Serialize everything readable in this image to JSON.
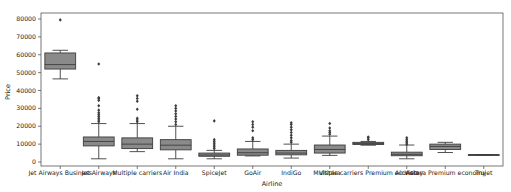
{
  "chart_data": {
    "type": "box",
    "title": "",
    "xlabel": "Airline",
    "ylabel": "Price",
    "ylim": [
      -3000,
      83000
    ],
    "yticks": [
      0,
      10000,
      20000,
      30000,
      40000,
      50000,
      60000,
      70000,
      80000
    ],
    "grid": false,
    "legend": null,
    "box_fill": "#8a8a8a",
    "line_color": "#3d3d3d",
    "categories": [
      "Jet Airways Business",
      "Jet Airways",
      "Multiple carriers",
      "Air India",
      "SpiceJet",
      "GoAir",
      "IndiGo",
      "Vistara",
      "Multiple carriers Premium economy",
      "Air Asia",
      "Vistara Premium economy",
      "Trujet"
    ],
    "series": [
      {
        "name": "Jet Airways Business",
        "whislo": 46500,
        "q1": 52000,
        "med": 54500,
        "q3": 61000,
        "whishi": 62500,
        "fliers": [
          79500
        ]
      },
      {
        "name": "Jet Airways",
        "whislo": 1800,
        "q1": 9000,
        "med": 11500,
        "q3": 14000,
        "whishi": 21500,
        "fliers": [
          22500,
          23500,
          24500,
          25500,
          26500,
          27500,
          29000,
          31500,
          34500,
          35500,
          36000,
          54800
        ]
      },
      {
        "name": "Multiple carriers",
        "whislo": 5800,
        "q1": 7500,
        "med": 10000,
        "q3": 13500,
        "whishi": 21500,
        "fliers": [
          22500,
          23500,
          24500,
          29500,
          34000,
          35500,
          37000
        ]
      },
      {
        "name": "Air India",
        "whislo": 1800,
        "q1": 6800,
        "med": 9400,
        "q3": 12500,
        "whishi": 20000,
        "fliers": [
          21000,
          22500,
          24000,
          25500,
          27000,
          28500,
          30000,
          31500
        ]
      },
      {
        "name": "SpiceJet",
        "whislo": 1800,
        "q1": 3200,
        "med": 3900,
        "q3": 5000,
        "whishi": 6500,
        "fliers": [
          7500,
          8500,
          9500,
          10500,
          11500,
          12500,
          23000
        ]
      },
      {
        "name": "GoAir",
        "whislo": 3400,
        "q1": 3800,
        "med": 5200,
        "q3": 7300,
        "whishi": 11500,
        "fliers": [
          12500,
          13500,
          17500,
          19500,
          21000,
          22500
        ]
      },
      {
        "name": "IndiGo",
        "whislo": 2200,
        "q1": 4000,
        "med": 5000,
        "q3": 6500,
        "whishi": 10000,
        "fliers": [
          11000,
          12000,
          13500,
          15000,
          16500,
          18000,
          19500,
          21000,
          22000
        ]
      },
      {
        "name": "Vistara",
        "whislo": 3700,
        "q1": 5000,
        "med": 7000,
        "q3": 9500,
        "whishi": 14500,
        "fliers": [
          15500,
          16500,
          17500,
          19000,
          21500
        ]
      },
      {
        "name": "Multiple carriers Premium economy",
        "whislo": 9400,
        "q1": 9800,
        "med": 10400,
        "q3": 11000,
        "whishi": 11500,
        "fliers": [
          12500,
          13500,
          14000
        ]
      },
      {
        "name": "Air Asia",
        "whislo": 1800,
        "q1": 3500,
        "med": 4300,
        "q3": 5500,
        "whishi": 9500,
        "fliers": [
          10000,
          10800,
          11600,
          12500,
          13500
        ]
      },
      {
        "name": "Vistara Premium economy",
        "whislo": 5300,
        "q1": 7000,
        "med": 8700,
        "q3": 10000,
        "whishi": 11000,
        "fliers": []
      },
      {
        "name": "Trujet",
        "whislo": 4100,
        "q1": 4100,
        "med": 4100,
        "q3": 4100,
        "whishi": 4100,
        "fliers": []
      }
    ]
  }
}
